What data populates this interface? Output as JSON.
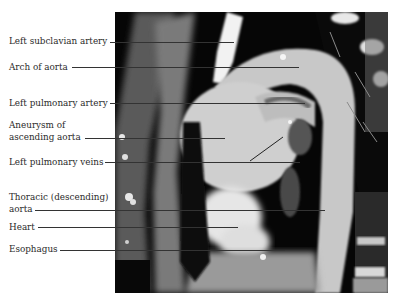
{
  "figure": {
    "labels": [
      {
        "text": "Left subclavian artery",
        "lines": [
          "Left subclavian artery"
        ]
      },
      {
        "text": "Arch of aorta",
        "lines": [
          "Arch of aorta"
        ]
      },
      {
        "text": "Left pulmonary artery",
        "lines": [
          "Left pulmonary artery"
        ]
      },
      {
        "text": "Aneurysm of ascending aorta",
        "lines": [
          "Aneurysm of",
          "ascending aorta"
        ]
      },
      {
        "text": "Left pulmonary veins",
        "lines": [
          "Left pulmonary veins"
        ]
      },
      {
        "text": "Thoracic (descending) aorta",
        "lines": [
          "Thoracic (descending)",
          "aorta"
        ]
      },
      {
        "text": "Heart",
        "lines": [
          "Heart"
        ]
      },
      {
        "text": "Esophagus",
        "lines": [
          "Esophagus"
        ]
      }
    ]
  }
}
